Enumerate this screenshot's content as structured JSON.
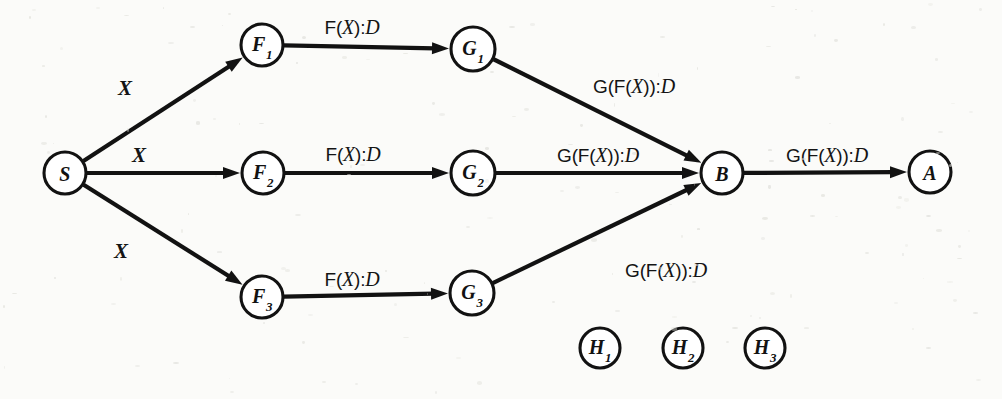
{
  "diagram": {
    "background_color": "#fbfbf9",
    "ink_color": "#121212",
    "nodes": [
      {
        "id": "S",
        "label": "S",
        "sub": "",
        "cx": 65,
        "cy": 173,
        "r": 21
      },
      {
        "id": "F1",
        "label": "F",
        "sub": "1",
        "cx": 262,
        "cy": 45,
        "r": 21
      },
      {
        "id": "F2",
        "label": "F",
        "sub": "2",
        "cx": 263,
        "cy": 173,
        "r": 21
      },
      {
        "id": "F3",
        "label": "F",
        "sub": "3",
        "cx": 262,
        "cy": 297,
        "r": 21
      },
      {
        "id": "G1",
        "label": "G",
        "sub": "1",
        "cx": 473,
        "cy": 49,
        "r": 22
      },
      {
        "id": "G2",
        "label": "G",
        "sub": "2",
        "cx": 473,
        "cy": 173,
        "r": 22
      },
      {
        "id": "G3",
        "label": "G",
        "sub": "3",
        "cx": 472,
        "cy": 293,
        "r": 22
      },
      {
        "id": "B",
        "label": "B",
        "sub": "",
        "cx": 722,
        "cy": 173,
        "r": 21
      },
      {
        "id": "A",
        "label": "A",
        "sub": "",
        "cx": 930,
        "cy": 172,
        "r": 21
      },
      {
        "id": "H1",
        "label": "H",
        "sub": "1",
        "cx": 600,
        "cy": 348,
        "r": 20
      },
      {
        "id": "H2",
        "label": "H",
        "sub": "2",
        "cx": 683,
        "cy": 348,
        "r": 20
      },
      {
        "id": "H3",
        "label": "H",
        "sub": "3",
        "cx": 765,
        "cy": 348,
        "r": 20
      }
    ],
    "edges": [
      {
        "id": "S-F1",
        "from": "S",
        "to": "F1",
        "label": "X",
        "label_kind": "var",
        "label_x": 125,
        "label_y": 88
      },
      {
        "id": "S-F2",
        "from": "S",
        "to": "F2",
        "label": "X",
        "label_kind": "var",
        "label_x": 139,
        "label_y": 155
      },
      {
        "id": "S-F3",
        "from": "S",
        "to": "F3",
        "label": "X",
        "label_kind": "var",
        "label_x": 121,
        "label_y": 251
      },
      {
        "id": "F1-G1",
        "from": "F1",
        "to": "G1",
        "label": "F(X):D",
        "label_kind": "call",
        "label_x": 352,
        "label_y": 27
      },
      {
        "id": "F2-G2",
        "from": "F2",
        "to": "G2",
        "label": "F(X):D",
        "label_kind": "call",
        "label_x": 353,
        "label_y": 154
      },
      {
        "id": "F3-G3",
        "from": "F3",
        "to": "G3",
        "label": "F(X):D",
        "label_kind": "call",
        "label_x": 352,
        "label_y": 279
      },
      {
        "id": "G1-B",
        "from": "G1",
        "to": "B",
        "label": "G(F(X)):D",
        "label_kind": "call",
        "label_x": 634,
        "label_y": 86
      },
      {
        "id": "G2-B",
        "from": "G2",
        "to": "B",
        "label": "G(F(X)):D",
        "label_kind": "call",
        "label_x": 598,
        "label_y": 155
      },
      {
        "id": "G3-B",
        "from": "G3",
        "to": "B",
        "label": "G(F(X)):D",
        "label_kind": "call",
        "label_x": 666,
        "label_y": 270
      },
      {
        "id": "B-A",
        "from": "B",
        "to": "A",
        "label": "G(F(X)):D",
        "label_kind": "call",
        "label_x": 827,
        "label_y": 155
      }
    ],
    "label_parts": {
      "f_call": {
        "pre": "F(",
        "var": "X",
        "mid": "):",
        "type": "D"
      },
      "g_call": {
        "pre": "G(F(",
        "var": "X",
        "mid": ")):",
        "type": "D"
      },
      "x_var": "X"
    }
  }
}
